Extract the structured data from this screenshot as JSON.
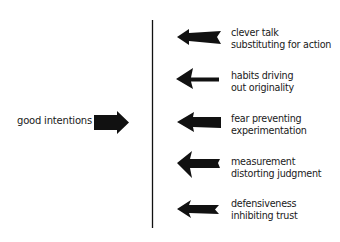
{
  "diagram": {
    "type": "force-field",
    "driving_force": {
      "label": "good intentions",
      "direction": "right"
    },
    "restraining_forces": [
      {
        "line1": "clever talk",
        "line2": "substituting for action",
        "direction": "left"
      },
      {
        "line1": "habits driving",
        "line2": "out originality",
        "direction": "left"
      },
      {
        "line1": "fear preventing",
        "line2": "experimentation",
        "direction": "left"
      },
      {
        "line1": "measurement",
        "line2": "distorting judgment",
        "direction": "left"
      },
      {
        "line1": "defensiveness",
        "line2": "inhibiting trust",
        "direction": "left"
      }
    ],
    "colors": {
      "ink": "#111111",
      "background": "#ffffff"
    }
  }
}
